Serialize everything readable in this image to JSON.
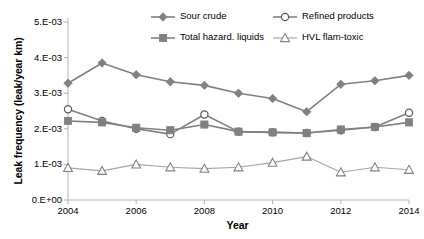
{
  "chart_data": {
    "type": "line",
    "title": "",
    "xlabel": "Year",
    "ylabel": "Leak frequency (leak/year km)",
    "x": [
      2004,
      2005,
      2006,
      2007,
      2008,
      2009,
      2010,
      2011,
      2012,
      2013,
      2014
    ],
    "xtick_labels": [
      "2004",
      "2006",
      "2008",
      "2010",
      "2012",
      "2014"
    ],
    "xticks": [
      2004,
      2006,
      2008,
      2010,
      2012,
      2014
    ],
    "ytick_labels": [
      "0.E+00",
      "1.E-03",
      "2.E-03",
      "3.E-03",
      "4.E-03",
      "5.E-03"
    ],
    "yticks": [
      0.0,
      0.001,
      0.002,
      0.003,
      0.004,
      0.005
    ],
    "xlim": [
      2004,
      2014
    ],
    "ylim": [
      0.0,
      0.005
    ],
    "grid": false,
    "legend_position": "top",
    "series": [
      {
        "name": "Sour crude",
        "marker": "filled-diamond",
        "color": "#808080",
        "values": [
          0.00328,
          0.00385,
          0.00352,
          0.00332,
          0.00322,
          0.003,
          0.00285,
          0.00248,
          0.00325,
          0.00335,
          0.0035
        ]
      },
      {
        "name": "Refined products",
        "marker": "open-circle",
        "color": "#808080",
        "values": [
          0.00255,
          0.00222,
          0.002,
          0.00185,
          0.0024,
          0.00192,
          0.0019,
          0.00188,
          0.00196,
          0.00205,
          0.00245
        ]
      },
      {
        "name": "Total hazard. liquids",
        "marker": "filled-square",
        "color": "#808080",
        "values": [
          0.00222,
          0.00218,
          0.00203,
          0.00196,
          0.00212,
          0.00192,
          0.0019,
          0.00188,
          0.00198,
          0.00205,
          0.00218
        ]
      },
      {
        "name": "HVL flam-toxic",
        "marker": "open-triangle",
        "color": "#a6a6a6",
        "values": [
          0.0009,
          0.00082,
          0.001,
          0.00092,
          0.00088,
          0.00092,
          0.00105,
          0.00122,
          0.00078,
          0.00092,
          0.00085
        ]
      }
    ]
  },
  "legend": {
    "items": [
      {
        "label": "Sour crude"
      },
      {
        "label": "Refined products"
      },
      {
        "label": "Total hazard. liquids"
      },
      {
        "label": "HVL flam-toxic"
      }
    ]
  },
  "axes": {
    "x_title": "Year",
    "y_title": "Leak frequency (leak/year km)"
  }
}
